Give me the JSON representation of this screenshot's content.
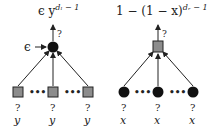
{
  "left_diagram": {
    "title": "ϵ y",
    "title_base": "ϵ y",
    "title_sup": "dₗ − 1",
    "input_label": "ϵ",
    "root_query": "?",
    "root_node_type": "variable-node (black circle)",
    "children": [
      {
        "query": "?",
        "label": "y"
      },
      {
        "query": "?",
        "label": "y"
      },
      {
        "query": "?",
        "label": "y"
      }
    ],
    "child_node_type": "check-node (gray square)",
    "ellipsis": "•••"
  },
  "right_diagram": {
    "title_base": "1 − (1 − x)",
    "title_sup": "dᵣ − 1",
    "root_query": "?",
    "root_node_type": "check-node (gray square)",
    "children": [
      {
        "query": "?",
        "label": "x"
      },
      {
        "query": "?",
        "label": "x"
      },
      {
        "query": "?",
        "label": "x"
      }
    ],
    "child_node_type": "variable-node (black circle)",
    "ellipsis": "•••"
  },
  "colors": {
    "node_black": "#111111",
    "node_gray": "#8c8c8c",
    "edge": "#222222"
  }
}
